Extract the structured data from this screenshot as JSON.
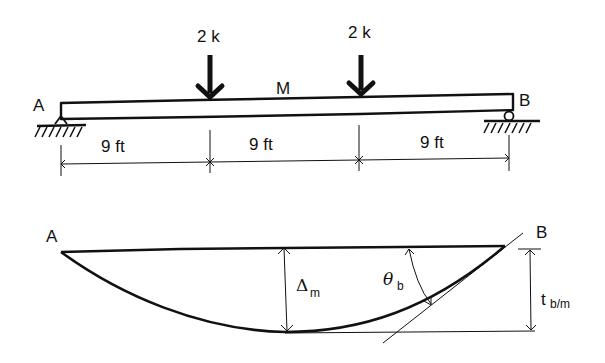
{
  "colors": {
    "ink": "#111111",
    "background": "#ffffff"
  },
  "beam": {
    "title": "Simply supported beam with two point loads",
    "left_support": {
      "label": "A",
      "type": "pin"
    },
    "right_support": {
      "label": "B",
      "type": "roller"
    },
    "midpoint_label": "M",
    "loads": [
      {
        "label": "2 k",
        "position_ft": 9
      },
      {
        "label": "2 k",
        "position_ft": 18
      }
    ],
    "spans": [
      {
        "label": "9 ft"
      },
      {
        "label": "9 ft"
      },
      {
        "label": "9 ft"
      }
    ],
    "total_length_ft": 27
  },
  "deflection": {
    "left_label": "A",
    "right_label": "B",
    "max_deflection_label": {
      "symbol": "Δ",
      "subscript": "m"
    },
    "slope_label": {
      "symbol": "θ",
      "subscript": "b"
    },
    "tangent_deviation_label": {
      "symbol": "t",
      "subscript": "b/m"
    }
  }
}
